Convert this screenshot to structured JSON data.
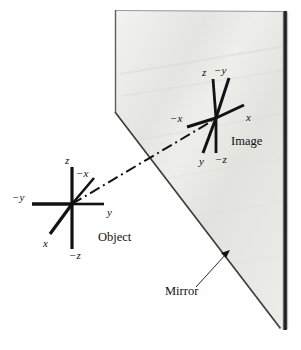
{
  "figure": {
    "background_color": "#ffffff",
    "ink_color": "#111111",
    "mirror_fill_color": "#e9e9e6",
    "mirror_edge_color": "#4a4a48",
    "mirror_thick_edge_color": "#2b2b2b"
  },
  "labels": {
    "object_caption": "Object",
    "image_caption": "Image",
    "mirror_caption": "Mirror"
  },
  "object_axes": {
    "name": "Object",
    "origin": {
      "x": 72,
      "y": 204
    },
    "axes": [
      {
        "id": "z",
        "label": "z",
        "tip": {
          "x": 72,
          "y": 167
        },
        "label_pos": {
          "x": 65,
          "y": 163
        }
      },
      {
        "id": "-z",
        "label": "−z",
        "tip": {
          "x": 72,
          "y": 248
        },
        "label_pos": {
          "x": 69,
          "y": 258
        }
      },
      {
        "id": "y",
        "label": "y",
        "tip": {
          "x": 104,
          "y": 204
        },
        "label_pos": {
          "x": 107,
          "y": 215
        }
      },
      {
        "id": "-y",
        "label": "−y",
        "tip": {
          "x": 32,
          "y": 204
        },
        "label_pos": {
          "x": 13,
          "y": 201
        }
      },
      {
        "id": "-x",
        "label": "−x",
        "tip": {
          "x": 93,
          "y": 178
        },
        "label_pos": {
          "x": 77,
          "y": 177
        }
      },
      {
        "id": "x",
        "label": "x",
        "tip": {
          "x": 51,
          "y": 233
        },
        "label_pos": {
          "x": 45,
          "y": 246
        }
      }
    ],
    "caption_pos": {
      "x": 99,
      "y": 240
    }
  },
  "image_axes": {
    "name": "Image",
    "origin": {
      "x": 216,
      "y": 118
    },
    "axes": [
      {
        "id": "z",
        "label": "z",
        "tip": {
          "x": 213,
          "y": 78
        },
        "label_pos": {
          "x": 203,
          "y": 75
        }
      },
      {
        "id": "-z",
        "label": "−z",
        "tip": {
          "x": 216,
          "y": 152
        },
        "label_pos": {
          "x": 215,
          "y": 162
        }
      },
      {
        "id": "-y",
        "label": "−y",
        "tip": {
          "x": 228,
          "y": 77
        },
        "label_pos": {
          "x": 216,
          "y": 73
        }
      },
      {
        "id": "y",
        "label": "y",
        "tip": {
          "x": 203,
          "y": 152
        },
        "label_pos": {
          "x": 200,
          "y": 164
        }
      },
      {
        "id": "x",
        "label": "x",
        "tip": {
          "x": 243,
          "y": 106
        },
        "label_pos": {
          "x": 246,
          "y": 120
        }
      },
      {
        "id": "-x",
        "label": "−x",
        "tip": {
          "x": 188,
          "y": 126
        },
        "label_pos": {
          "x": 172,
          "y": 121
        }
      }
    ],
    "caption_pos": {
      "x": 232,
      "y": 145
    }
  },
  "ray": {
    "name": "chief-ray",
    "style": "dash-dot",
    "from": {
      "x": 72,
      "y": 204
    },
    "to": {
      "x": 212,
      "y": 122
    }
  },
  "mirror": {
    "name": "mirror-plane",
    "outline_points": "115,10 115,112 280,328 288,328 288,12",
    "front_edge_points": "115,112 280,328",
    "top_edge_points": "115,10 288,12",
    "thick_right_edge": {
      "x1": 285,
      "y1": 12,
      "x2": 285,
      "y2": 330
    },
    "caption_pos": {
      "x": 168,
      "y": 292
    },
    "leader_line": {
      "x1": 196,
      "y1": 286,
      "x2": 227,
      "y2": 253
    },
    "arrow_tip": {
      "x": 229,
      "y": 251
    }
  }
}
